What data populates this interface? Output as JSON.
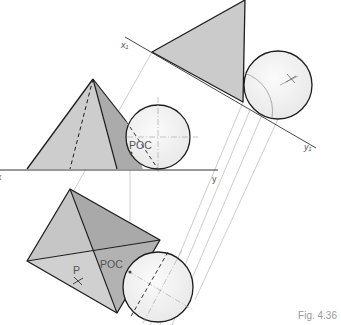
{
  "figure": {
    "caption": "Fig. 4.36",
    "labels": {
      "x1": "x₁",
      "y1": "y₁",
      "x": "x",
      "y": "y",
      "poc_front": "POC",
      "poc_plan": "POC",
      "point_p": "P"
    }
  },
  "colors": {
    "face_light": "#d2d2d2",
    "face_mid": "#c4c4c4",
    "face_dark": "#a9a9a9",
    "sphere_fill": "#f0f0f0",
    "outline": "#222222",
    "construction": "#b8b8b8"
  }
}
